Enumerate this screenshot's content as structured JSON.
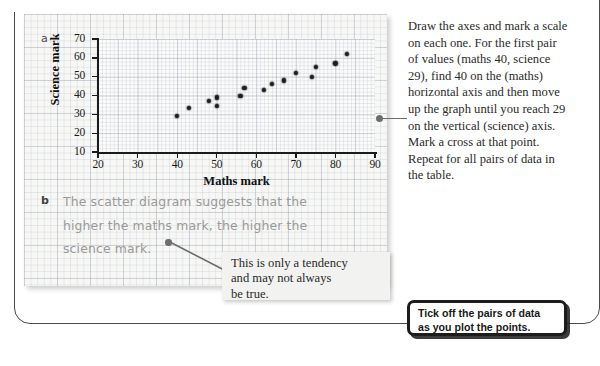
{
  "chart_data": {
    "type": "scatter",
    "title": "",
    "xlabel": "Maths mark",
    "ylabel": "Science mark",
    "xlim": [
      20,
      90
    ],
    "ylim": [
      10,
      70
    ],
    "xticks": [
      20,
      30,
      40,
      50,
      60,
      70,
      80,
      90
    ],
    "yticks": [
      10,
      20,
      30,
      40,
      50,
      60,
      70
    ],
    "grid": true,
    "legend": null,
    "points": [
      {
        "x": 40,
        "y": 29
      },
      {
        "x": 43,
        "y": 33.5
      },
      {
        "x": 48,
        "y": 37
      },
      {
        "x": 50,
        "y": 39
      },
      {
        "x": 50,
        "y": 34.5
      },
      {
        "x": 56,
        "y": 40
      },
      {
        "x": 57,
        "y": 44
      },
      {
        "x": 62,
        "y": 43
      },
      {
        "x": 64,
        "y": 46
      },
      {
        "x": 67,
        "y": 48
      },
      {
        "x": 70,
        "y": 52
      },
      {
        "x": 74,
        "y": 50
      },
      {
        "x": 75,
        "y": 55
      },
      {
        "x": 80,
        "y": 57
      },
      {
        "x": 83,
        "y": 62
      }
    ]
  },
  "items": {
    "letter_a": "a",
    "letter_b": "b"
  },
  "answer_b": {
    "line1": "The scatter diagram suggests that the",
    "line2": "higher the maths mark, the higher the",
    "line3": "science mark."
  },
  "instructions": {
    "text": "Draw the axes and mark a scale on each one.\nFor the first pair of values (maths 40, science 29), find 40 on the (maths) horizontal axis and then move up the graph until you reach 29 on the vertical (science) axis. Mark a cross at that point. Repeat for all pairs of data in the table."
  },
  "tendency_callout": {
    "line1": "This is only a tendency",
    "line2": "and may not always",
    "line3": "be true."
  },
  "tickoff_callout": {
    "line1": "Tick off the pairs of data",
    "line2": "as you plot the points."
  },
  "colors": {
    "point": "#1d1d1d",
    "axis": "#1b1b1b",
    "handwriting": "#9a9a9a",
    "callout_border": "#1c1c1c",
    "leader": "#6d6d6d"
  }
}
